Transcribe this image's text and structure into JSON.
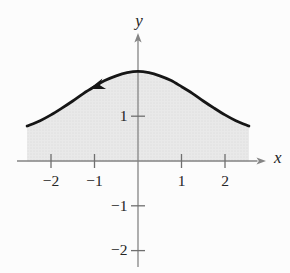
{
  "figure": {
    "background": "#fcfcfc"
  },
  "chart_data": {
    "type": "area",
    "title": "",
    "xlabel": "x",
    "ylabel": "y",
    "xlim": [
      -2.75,
      2.9
    ],
    "ylim": [
      -2.6,
      2.85
    ],
    "grid": false,
    "x_ticks": [
      -2,
      -1,
      1,
      2
    ],
    "x_tick_labels": [
      "−2",
      "−1",
      "1",
      "2"
    ],
    "y_ticks": [
      1,
      -1,
      -2
    ],
    "y_tick_labels": [
      "1",
      "−1",
      "−2"
    ],
    "series": [
      {
        "name": "bell-shaped curve, shaded region between curve and x-axis",
        "points": [
          [
            -2.55,
            0.78
          ],
          [
            -2.25,
            0.9
          ],
          [
            -2.0,
            1.03
          ],
          [
            -1.75,
            1.18
          ],
          [
            -1.5,
            1.34
          ],
          [
            -1.25,
            1.51
          ],
          [
            -1.0,
            1.66
          ],
          [
            -0.75,
            1.8
          ],
          [
            -0.5,
            1.9
          ],
          [
            -0.25,
            1.97
          ],
          [
            0.0,
            2.0
          ],
          [
            0.25,
            1.97
          ],
          [
            0.5,
            1.9
          ],
          [
            0.75,
            1.8
          ],
          [
            1.0,
            1.66
          ],
          [
            1.25,
            1.51
          ],
          [
            1.5,
            1.34
          ],
          [
            1.75,
            1.18
          ],
          [
            2.0,
            1.03
          ],
          [
            2.25,
            0.9
          ],
          [
            2.55,
            0.78
          ]
        ],
        "stroke": "#161616",
        "stroke_width": 2.8,
        "fill": "#e7e7e7"
      }
    ],
    "orientation_arrow": {
      "tip_x": -1.125,
      "points_toward": "negative x (curve traversed right to left)",
      "color": "#161616"
    },
    "axis_color": "#858585",
    "tick_color": "#6f6f6f",
    "text_color": "#252525",
    "shade_base": "#e9e9e9",
    "shade_dot": "#d5d5d5"
  }
}
